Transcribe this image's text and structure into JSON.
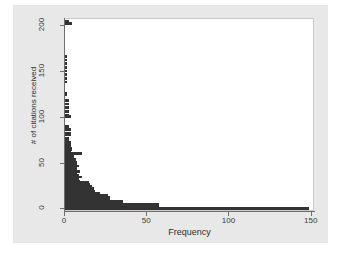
{
  "chart_data": {
    "type": "bar",
    "orientation": "horizontal",
    "title": "",
    "subtitle": "",
    "xlabel": "Frequency",
    "ylabel": "# of citations received",
    "xlim": [
      0,
      152
    ],
    "ylim": [
      -3,
      208
    ],
    "xticks": [
      0,
      50,
      100,
      150
    ],
    "yticks": [
      0,
      50,
      100,
      150,
      200
    ],
    "xtick_labels": [
      "0",
      "50",
      "100",
      "150"
    ],
    "ytick_labels": [
      "0",
      "50",
      "100",
      "150",
      "200"
    ],
    "grid": false,
    "legend": null,
    "bar_color": "#333333",
    "plot_background": "#ffffff",
    "figure_background": "#e8e8e8",
    "axis_color": "#6e6e6e",
    "categories": [
      0,
      2,
      4,
      6,
      8,
      10,
      12,
      14,
      16,
      18,
      20,
      22,
      24,
      26,
      28,
      30,
      32,
      34,
      36,
      38,
      40,
      42,
      44,
      46,
      48,
      50,
      52,
      54,
      56,
      58,
      60,
      62,
      64,
      66,
      68,
      70,
      72,
      74,
      76,
      80,
      82,
      86,
      88,
      90,
      100,
      102,
      106,
      110,
      114,
      118,
      124,
      126,
      138,
      142,
      146,
      150,
      154,
      158,
      162,
      166,
      202,
      204
    ],
    "values": [
      149,
      58,
      58,
      36,
      36,
      28,
      28,
      27,
      22,
      19,
      18,
      18,
      17,
      16,
      15,
      10,
      9,
      11,
      9,
      8,
      10,
      8,
      8,
      9,
      8,
      8,
      7,
      7,
      6,
      6,
      11,
      4,
      5,
      5,
      4,
      4,
      4,
      3,
      3,
      4,
      4,
      4,
      3,
      3,
      4,
      3,
      3,
      3,
      3,
      3,
      2,
      2,
      2,
      2,
      2,
      2,
      2,
      2,
      2,
      2,
      5,
      3
    ]
  },
  "axes": {
    "x_title": "Frequency",
    "y_title": "# of citations received"
  }
}
